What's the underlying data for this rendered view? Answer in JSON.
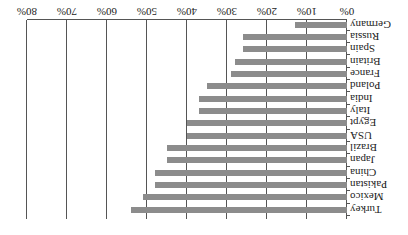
{
  "chart_data": {
    "type": "bar",
    "orientation": "horizontal",
    "rendering": "rotated 180 degrees",
    "title": "",
    "xlabel": "",
    "ylabel": "",
    "xlim": [
      0,
      80
    ],
    "x_tick_labels": [
      "0%",
      "10%",
      "20%",
      "30%",
      "40%",
      "50%",
      "60%",
      "70%",
      "80%"
    ],
    "grid": "vertical gridlines at each 10%",
    "bar_color": "#8c8c8c",
    "categories": [
      "Germany",
      "Russia",
      "Spain",
      "Britain",
      "France",
      "Poland",
      "India",
      "Italy",
      "Egypt",
      "USA",
      "Brazil",
      "Japan",
      "China",
      "Pakistan",
      "Mexico",
      "Turkey"
    ],
    "values": [
      13,
      26,
      26,
      28,
      29,
      35,
      37,
      37,
      40,
      40,
      45,
      45,
      48,
      48,
      51,
      54
    ],
    "unit": "%"
  }
}
